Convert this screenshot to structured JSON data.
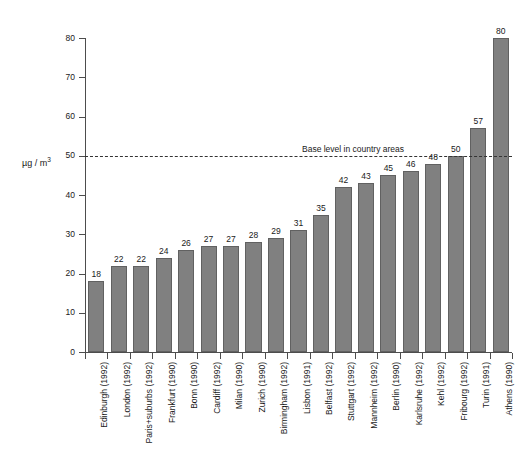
{
  "chart_data": {
    "type": "bar",
    "title": "",
    "subtitle": "",
    "xlabel": "",
    "ylabel": "µg / m",
    "ylabel_exponent": "3",
    "ylim": [
      0,
      80
    ],
    "yticks": [
      0,
      10,
      20,
      30,
      40,
      50,
      60,
      70,
      80
    ],
    "grid": false,
    "legend": null,
    "orientation": "vertical",
    "bar_color": "#808080",
    "bar_edge_color": "#616161",
    "axis_color": "#4d4d4d",
    "categories": [
      "Edinburgh (1992)",
      "London (1992)",
      "Paris+suburbs (1992)",
      "Frankfurt (1990)",
      "Bonn (1990)",
      "Cardiff (1992)",
      "Milan (1990)",
      "Zurich (1990)",
      "Birmingham (1992)",
      "Lisbon (1991)",
      "Belfast (1992)",
      "Stuttgart (1992)",
      "Mannheim (1992)",
      "Berlin (1990)",
      "Karlsruhe (1992)",
      "Kehl (1992)",
      "Fribourg (1992)",
      "Turin (1991)",
      "Athens (1990)"
    ],
    "values": [
      18,
      22,
      22,
      24,
      26,
      27,
      27,
      28,
      29,
      31,
      35,
      42,
      43,
      45,
      46,
      48,
      50,
      57,
      80
    ],
    "annotations": [
      {
        "type": "reference-line",
        "value": 50,
        "label": "Base level in country areas",
        "style": "dashed",
        "color": "#333333"
      }
    ]
  }
}
